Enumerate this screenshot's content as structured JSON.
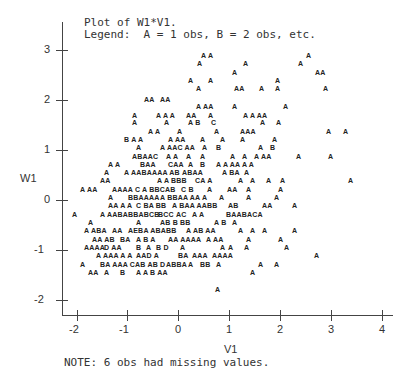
{
  "header": {
    "title": "Plot of W1*V1.",
    "legend": "Legend:  A = 1 obs, B = 2 obs, etc."
  },
  "footer": {
    "note": "NOTE: 6 obs had missing values."
  },
  "chart_data": {
    "type": "scatter",
    "title": "Plot of W1*V1.",
    "subtitle": "Legend:  A = 1 obs, B = 2 obs, etc.",
    "xlabel": "V1",
    "ylabel": "W1",
    "xlim": [
      -2.3,
      4.0
    ],
    "ylim": [
      -2.3,
      3.0
    ],
    "x_ticks": [
      "-2",
      "-1",
      "0",
      "1",
      "2",
      "3",
      "4"
    ],
    "y_ticks": [
      "3",
      "2",
      "1",
      "0",
      "-1",
      "-2"
    ],
    "grid": false,
    "legend_position": "top",
    "legend": {
      "A": 1,
      "B": 2,
      "C": 3,
      "D": 4,
      "E": 5
    },
    "annotation": "NOTE: 6 obs had missing values.",
    "rows": [
      {
        "y": 55,
        "segs": [
          [
            201,
            "A A"
          ],
          [
            306,
            "A"
          ]
        ]
      },
      {
        "y": 63,
        "segs": [
          [
            197,
            "A"
          ],
          [
            243,
            "A"
          ],
          [
            298,
            "A"
          ]
        ]
      },
      {
        "y": 72,
        "segs": [
          [
            232,
            "A"
          ],
          [
            315,
            "AA"
          ]
        ]
      },
      {
        "y": 80,
        "segs": [
          [
            188,
            "A"
          ],
          [
            208,
            "A"
          ],
          [
            275,
            "A"
          ]
        ]
      },
      {
        "y": 88,
        "segs": [
          [
            196,
            "A"
          ],
          [
            234,
            "AA"
          ],
          [
            259,
            "A"
          ],
          [
            275,
            "A"
          ],
          [
            323,
            "A"
          ]
        ]
      },
      {
        "y": 99,
        "segs": [
          [
            144,
            "AA"
          ],
          [
            160,
            "AA"
          ]
        ]
      },
      {
        "y": 106,
        "segs": [
          [
            196,
            "A AA"
          ],
          [
            232,
            "A"
          ],
          [
            283,
            "A"
          ]
        ]
      },
      {
        "y": 115,
        "segs": [
          [
            132,
            "A"
          ],
          [
            156,
            "A A A"
          ],
          [
            186,
            "AA"
          ],
          [
            208,
            "A"
          ],
          [
            243,
            "A A AA"
          ]
        ]
      },
      {
        "y": 122,
        "segs": [
          [
            132,
            "A"
          ],
          [
            164,
            "A"
          ],
          [
            188,
            "A B"
          ],
          [
            211,
            "C"
          ],
          [
            260,
            "A"
          ],
          [
            276,
            "A"
          ]
        ]
      },
      {
        "y": 131,
        "segs": [
          [
            148,
            "A A"
          ],
          [
            177,
            "A"
          ],
          [
            214,
            "A"
          ],
          [
            240,
            "AAA"
          ],
          [
            326,
            "A"
          ],
          [
            343,
            "A"
          ]
        ]
      },
      {
        "y": 139,
        "segs": [
          [
            124,
            "B A A"
          ],
          [
            168,
            "A AA"
          ],
          [
            200,
            "A"
          ],
          [
            220,
            "A"
          ],
          [
            240,
            "A"
          ],
          [
            272,
            "A"
          ]
        ]
      },
      {
        "y": 147,
        "segs": [
          [
            136,
            "A"
          ],
          [
            160,
            "A AAC AA"
          ],
          [
            202,
            "A"
          ],
          [
            216,
            "B"
          ],
          [
            258,
            "A"
          ],
          [
            270,
            "B"
          ]
        ]
      },
      {
        "y": 156,
        "segs": [
          [
            132,
            "ABAAC"
          ],
          [
            166,
            "A A"
          ],
          [
            186,
            "A"
          ],
          [
            200,
            "A"
          ],
          [
            230,
            "A"
          ],
          [
            242,
            "A"
          ],
          [
            254,
            "A AA"
          ],
          [
            296,
            "A"
          ],
          [
            328,
            "A"
          ]
        ]
      },
      {
        "y": 164,
        "segs": [
          [
            108,
            "A A"
          ],
          [
            140,
            "BAA"
          ],
          [
            168,
            "CAA"
          ],
          [
            188,
            "A"
          ],
          [
            200,
            "B"
          ],
          [
            216,
            "A A AA A A"
          ]
        ]
      },
      {
        "y": 172,
        "segs": [
          [
            104,
            "A"
          ],
          [
            124,
            "A AABAAAA AB"
          ],
          [
            182,
            "ABAA"
          ],
          [
            222,
            "A BA"
          ],
          [
            244,
            "A"
          ]
        ]
      },
      {
        "y": 180,
        "segs": [
          [
            100,
            "AA"
          ],
          [
            157,
            "A A BBB"
          ],
          [
            195,
            "CA A"
          ],
          [
            238,
            "A"
          ],
          [
            250,
            "A"
          ],
          [
            266,
            "A"
          ],
          [
            280,
            "A"
          ],
          [
            348,
            "A"
          ]
        ]
      },
      {
        "y": 189,
        "segs": [
          [
            80,
            "A AA"
          ],
          [
            112,
            "AAAA C A BBCAB"
          ],
          [
            181,
            "C B"
          ],
          [
            207,
            "A"
          ],
          [
            227,
            "AA"
          ],
          [
            246,
            "A"
          ],
          [
            278,
            "A"
          ]
        ]
      },
      {
        "y": 197,
        "segs": [
          [
            108,
            "A"
          ],
          [
            128,
            "BBAAAA"
          ],
          [
            160,
            "A BBAA AA"
          ],
          [
            202,
            "A"
          ],
          [
            219,
            "A"
          ],
          [
            246,
            "A"
          ],
          [
            274,
            "A"
          ]
        ]
      },
      {
        "y": 205,
        "segs": [
          [
            108,
            "AA A A"
          ],
          [
            136,
            "C BA BB"
          ],
          [
            172,
            "A BAA AABB"
          ],
          [
            228,
            "AB"
          ],
          [
            262,
            "AA"
          ],
          [
            292,
            "A"
          ]
        ]
      },
      {
        "y": 214,
        "segs": [
          [
            72,
            "A"
          ],
          [
            100,
            "A AABABBABCB"
          ],
          [
            158,
            "BCC"
          ],
          [
            176,
            "AC"
          ],
          [
            192,
            "A A"
          ],
          [
            226,
            "BAABACA"
          ]
        ]
      },
      {
        "y": 222,
        "segs": [
          [
            88,
            "A"
          ],
          [
            136,
            "A"
          ],
          [
            160,
            "AB B"
          ],
          [
            180,
            "BB"
          ],
          [
            214,
            "A B"
          ],
          [
            232,
            "A"
          ]
        ]
      },
      {
        "y": 230,
        "segs": [
          [
            84,
            "A ABA"
          ],
          [
            112,
            "AA"
          ],
          [
            128,
            "AEBA ABABB"
          ],
          [
            186,
            "A AB AA"
          ],
          [
            238,
            "A"
          ],
          [
            250,
            "A"
          ],
          [
            262,
            "A"
          ],
          [
            292,
            "A"
          ]
        ]
      },
      {
        "y": 239,
        "segs": [
          [
            92,
            "AA AB"
          ],
          [
            120,
            "BA"
          ],
          [
            136,
            "A B A"
          ],
          [
            168,
            "AA AAAA"
          ],
          [
            206,
            "A AA"
          ],
          [
            246,
            "A"
          ],
          [
            278,
            "A"
          ]
        ]
      },
      {
        "y": 247,
        "segs": [
          [
            84,
            "AAAA"
          ],
          [
            104,
            "D AA"
          ],
          [
            136,
            "B"
          ],
          [
            146,
            "A"
          ],
          [
            156,
            "B D"
          ],
          [
            180,
            "A"
          ],
          [
            220,
            "A"
          ],
          [
            228,
            "A"
          ],
          [
            244,
            "A"
          ],
          [
            284,
            "A"
          ]
        ]
      },
      {
        "y": 255,
        "segs": [
          [
            96,
            "A AAA A A"
          ],
          [
            136,
            "AAD A"
          ],
          [
            178,
            "BA"
          ],
          [
            192,
            "AAA"
          ],
          [
            212,
            "AAAA"
          ],
          [
            314,
            "A"
          ]
        ]
      },
      {
        "y": 264,
        "segs": [
          [
            80,
            "A"
          ],
          [
            100,
            "BA AAA CAB AB D"
          ],
          [
            166,
            "ABBA"
          ],
          [
            188,
            "A"
          ],
          [
            200,
            "BB"
          ],
          [
            216,
            "A"
          ],
          [
            258,
            "A"
          ],
          [
            274,
            "A"
          ]
        ]
      },
      {
        "y": 272,
        "segs": [
          [
            88,
            "AA"
          ],
          [
            104,
            "A"
          ],
          [
            120,
            "B"
          ],
          [
            136,
            "A A B AA"
          ],
          [
            250,
            "A"
          ]
        ]
      },
      {
        "y": 289,
        "segs": [
          [
            215,
            "A"
          ]
        ]
      }
    ]
  }
}
